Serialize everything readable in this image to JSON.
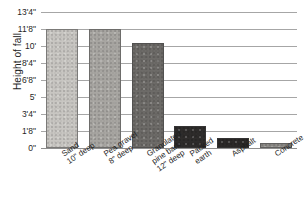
{
  "chart_data": {
    "type": "bar",
    "title": "",
    "xlabel": "",
    "ylabel": "Height of fall",
    "ylim": [
      0,
      13.3333
    ],
    "y_unit": "feet",
    "grid": true,
    "legend": "none",
    "y_tick_labels": [
      "13'4\"",
      "11'8\"",
      "10'",
      "8'4\"",
      "6'8\"",
      "5'",
      "3'4\"",
      "1'8\"",
      "0\""
    ],
    "y_tick_values": [
      13.3333,
      11.6667,
      10.0,
      8.3333,
      6.6667,
      5.0,
      3.3333,
      1.6667,
      0
    ],
    "categories": [
      "Sand 10\" deep",
      "Pea gravel 8\" deep",
      "Granulated pine bark 12\" deep",
      "Packed earth",
      "Asphalt",
      "Concrete"
    ],
    "values": [
      11.6667,
      11.6667,
      10.3333,
      2.1667,
      1.0,
      0.5
    ],
    "value_labels": [
      "11'8\"",
      "11'8\"",
      "10'4\"",
      "2'2\"",
      "1'0\"",
      "0'6\""
    ],
    "bar_colors": [
      "#c8c6c2",
      "#a8a6a2",
      "#6d6b68",
      "#2e2c2b",
      "#2b2928",
      "#8e8c89"
    ]
  },
  "axis": {
    "y_title": "Height of fall",
    "ticks": [
      {
        "label": "13'4\"",
        "value": 13.3333
      },
      {
        "label": "11'8\"",
        "value": 11.6667
      },
      {
        "label": "10'",
        "value": 10.0
      },
      {
        "label": "8'4\"",
        "value": 8.3333
      },
      {
        "label": "6'8\"",
        "value": 6.6667
      },
      {
        "label": "5'",
        "value": 5.0
      },
      {
        "label": "3'4\"",
        "value": 3.3333
      },
      {
        "label": "1'8\"",
        "value": 1.6667
      },
      {
        "label": "0\"",
        "value": 0
      }
    ]
  },
  "categories": [
    {
      "line1": "Sand",
      "line2": "10\" deep",
      "line3": ""
    },
    {
      "line1": "Pea gravel",
      "line2": "8\" deep",
      "line3": ""
    },
    {
      "line1": "Granulated",
      "line2": "pine bark",
      "line3": "12\" deep"
    },
    {
      "line1": "Packed",
      "line2": "earth",
      "line3": ""
    },
    {
      "line1": "Asphalt",
      "line2": "",
      "line3": ""
    },
    {
      "line1": "Concrete",
      "line2": "",
      "line3": ""
    }
  ]
}
